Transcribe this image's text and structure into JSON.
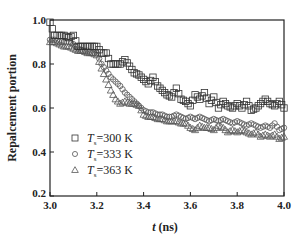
{
  "chart_data": {
    "type": "scatter",
    "title": "",
    "xlabel": "t (ns)",
    "ylabel": "Repalcement portion",
    "xlim": [
      3.0,
      4.0
    ],
    "ylim": [
      0.2,
      1.0
    ],
    "xticks": [
      3.0,
      3.2,
      3.4,
      3.6,
      3.8,
      4.0
    ],
    "yticks": [
      0.2,
      0.4,
      0.6,
      0.8,
      1.0
    ],
    "xtick_labels": [
      "3.0",
      "3.2",
      "3.4",
      "3.6",
      "3.8",
      "4.0"
    ],
    "ytick_labels": [
      "0.2",
      "0.4",
      "0.6",
      "0.8",
      "1.0"
    ],
    "grid": false,
    "legend_position": "lower left",
    "series": [
      {
        "name": "Ts=300 K",
        "legend_main": "T",
        "legend_sub": "s",
        "legend_rest": "=300 K",
        "marker": "square",
        "x": [
          3.0,
          3.02,
          3.04,
          3.06,
          3.08,
          3.1,
          3.12,
          3.14,
          3.16,
          3.18,
          3.2,
          3.22,
          3.24,
          3.26,
          3.28,
          3.3,
          3.32,
          3.34,
          3.36,
          3.38,
          3.4,
          3.42,
          3.44,
          3.46,
          3.48,
          3.5,
          3.52,
          3.54,
          3.56,
          3.58,
          3.6,
          3.62,
          3.64,
          3.66,
          3.68,
          3.7,
          3.72,
          3.74,
          3.76,
          3.78,
          3.8,
          3.82,
          3.84,
          3.86,
          3.88,
          3.9,
          3.92,
          3.94,
          3.96,
          3.98,
          4.0
        ],
        "y": [
          0.99,
          0.93,
          0.93,
          0.93,
          0.92,
          0.93,
          0.88,
          0.88,
          0.88,
          0.88,
          0.88,
          0.85,
          0.85,
          0.8,
          0.8,
          0.8,
          0.82,
          0.79,
          0.76,
          0.75,
          0.73,
          0.71,
          0.74,
          0.7,
          0.68,
          0.66,
          0.65,
          0.69,
          0.64,
          0.63,
          0.61,
          0.66,
          0.64,
          0.67,
          0.62,
          0.65,
          0.6,
          0.63,
          0.61,
          0.6,
          0.62,
          0.6,
          0.63,
          0.59,
          0.6,
          0.62,
          0.64,
          0.62,
          0.61,
          0.63,
          0.6
        ]
      },
      {
        "name": "Ts=333 K",
        "legend_main": "T",
        "legend_sub": "s",
        "legend_rest": "=333 K",
        "marker": "circle",
        "x": [
          3.0,
          3.02,
          3.04,
          3.06,
          3.08,
          3.1,
          3.12,
          3.14,
          3.16,
          3.18,
          3.2,
          3.22,
          3.24,
          3.26,
          3.28,
          3.3,
          3.32,
          3.34,
          3.36,
          3.38,
          3.4,
          3.42,
          3.44,
          3.46,
          3.48,
          3.5,
          3.52,
          3.54,
          3.56,
          3.58,
          3.6,
          3.62,
          3.64,
          3.66,
          3.68,
          3.7,
          3.72,
          3.74,
          3.76,
          3.78,
          3.8,
          3.82,
          3.84,
          3.86,
          3.88,
          3.9,
          3.92,
          3.94,
          3.96,
          3.98,
          4.0
        ],
        "y": [
          0.91,
          0.91,
          0.9,
          0.9,
          0.9,
          0.89,
          0.87,
          0.86,
          0.86,
          0.85,
          0.85,
          0.8,
          0.77,
          0.74,
          0.72,
          0.7,
          0.67,
          0.65,
          0.63,
          0.61,
          0.59,
          0.58,
          0.58,
          0.57,
          0.57,
          0.56,
          0.56,
          0.57,
          0.56,
          0.55,
          0.56,
          0.55,
          0.56,
          0.55,
          0.54,
          0.55,
          0.54,
          0.55,
          0.54,
          0.53,
          0.54,
          0.53,
          0.52,
          0.53,
          0.52,
          0.51,
          0.52,
          0.51,
          0.53,
          0.5,
          0.51
        ]
      },
      {
        "name": "Ts=363 K",
        "legend_main": "T",
        "legend_sub": "s",
        "legend_rest": "=363 K",
        "marker": "triangle",
        "x": [
          3.0,
          3.02,
          3.04,
          3.06,
          3.08,
          3.1,
          3.12,
          3.14,
          3.16,
          3.18,
          3.2,
          3.22,
          3.24,
          3.26,
          3.28,
          3.3,
          3.32,
          3.34,
          3.36,
          3.38,
          3.4,
          3.42,
          3.44,
          3.46,
          3.48,
          3.5,
          3.52,
          3.54,
          3.56,
          3.58,
          3.6,
          3.62,
          3.64,
          3.66,
          3.68,
          3.7,
          3.72,
          3.74,
          3.76,
          3.78,
          3.8,
          3.82,
          3.84,
          3.86,
          3.88,
          3.9,
          3.92,
          3.94,
          3.96,
          3.98,
          4.0
        ],
        "y": [
          0.9,
          0.9,
          0.89,
          0.88,
          0.88,
          0.87,
          0.86,
          0.86,
          0.85,
          0.85,
          0.84,
          0.78,
          0.73,
          0.68,
          0.64,
          0.62,
          0.63,
          0.62,
          0.62,
          0.61,
          0.57,
          0.56,
          0.56,
          0.55,
          0.55,
          0.54,
          0.54,
          0.54,
          0.53,
          0.53,
          0.51,
          0.5,
          0.52,
          0.51,
          0.51,
          0.5,
          0.52,
          0.51,
          0.49,
          0.5,
          0.49,
          0.5,
          0.49,
          0.48,
          0.49,
          0.47,
          0.48,
          0.47,
          0.48,
          0.46,
          0.47
        ]
      }
    ]
  }
}
